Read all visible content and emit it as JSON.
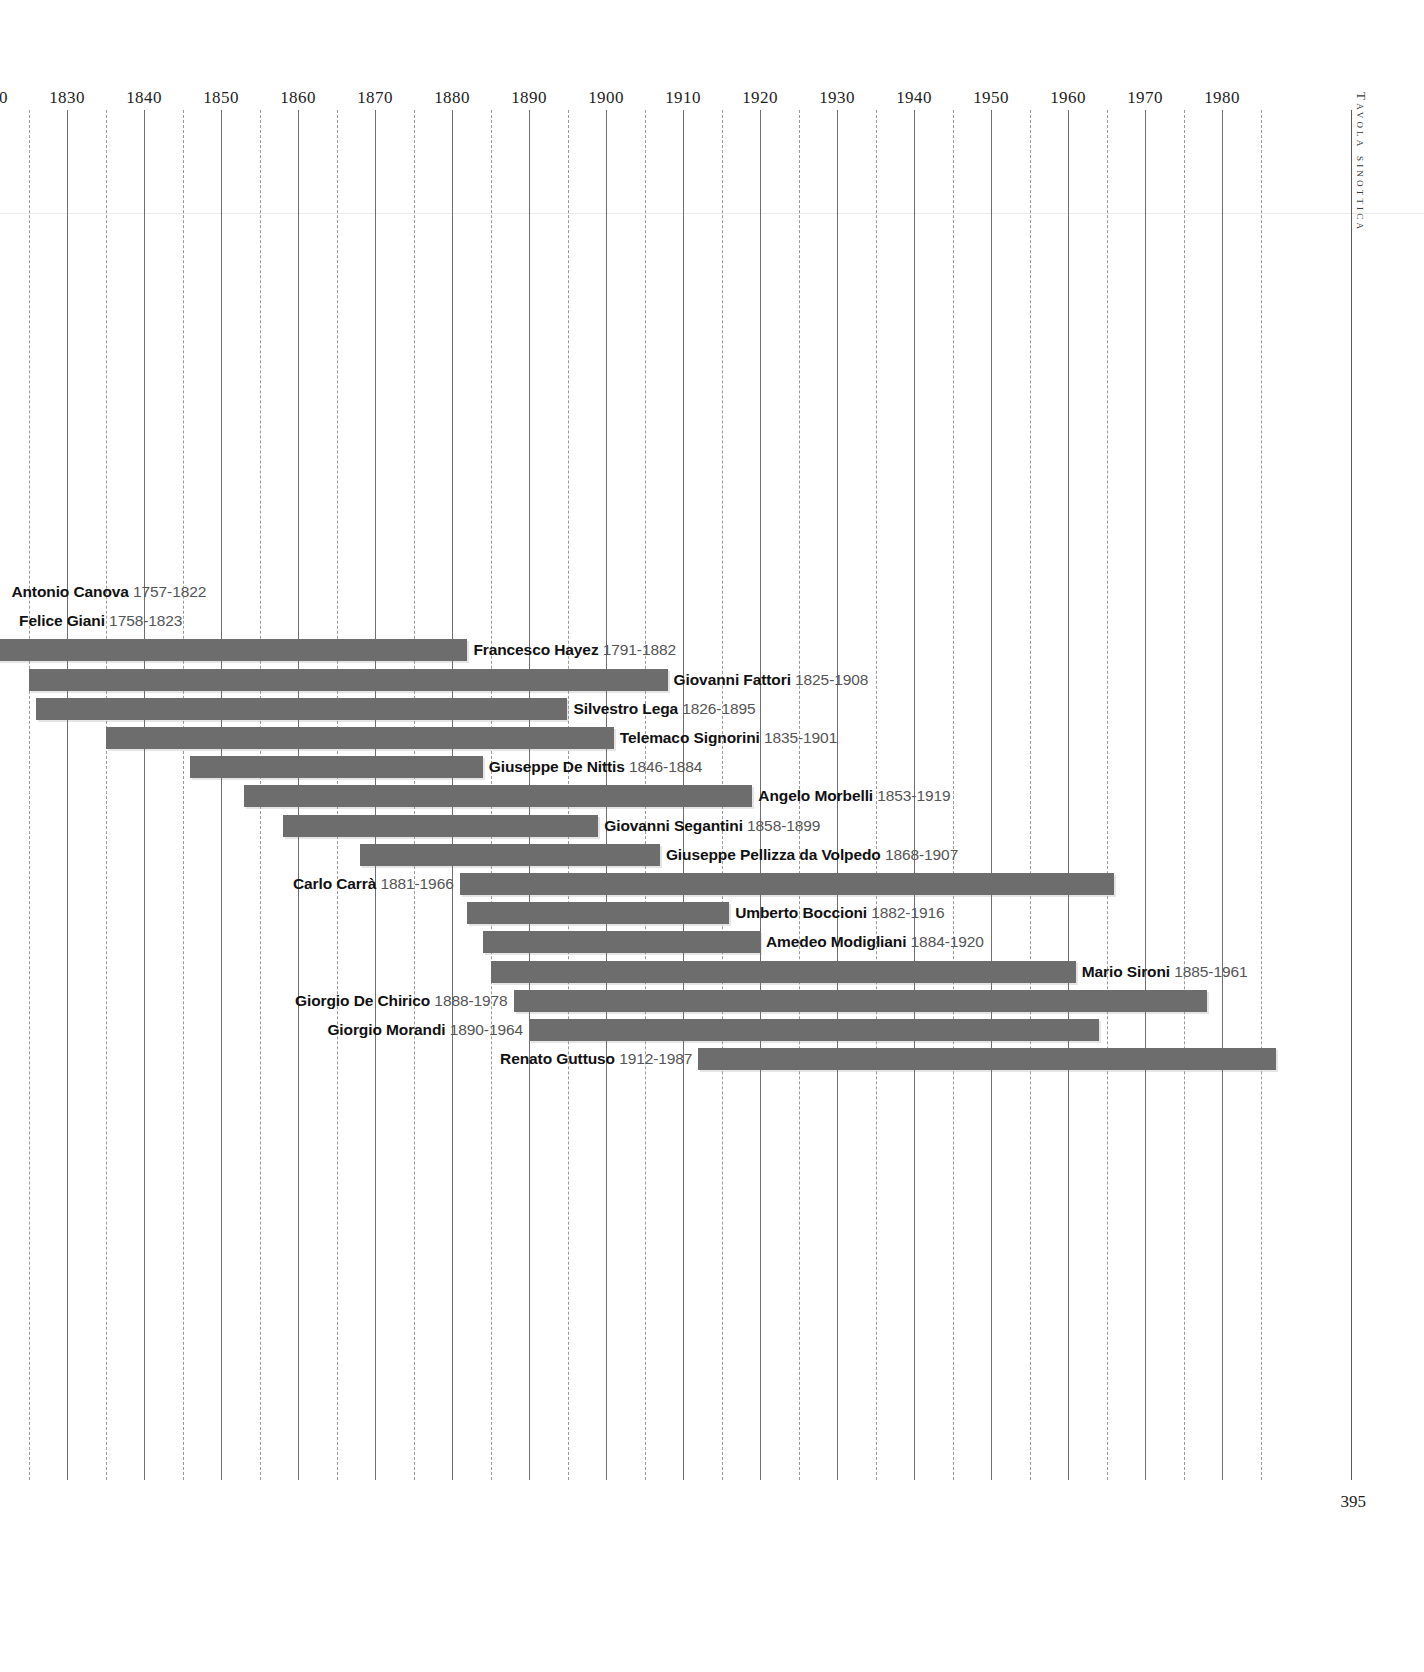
{
  "document": {
    "side_caption": "Tavola sinottica",
    "page_number": "395"
  },
  "chart_data": {
    "type": "bar",
    "title": "Tavola sinottica",
    "orientation": "horizontal",
    "subtype": "timeline-gantt",
    "xlabel": "",
    "ylabel": "",
    "xlim": [
      1820,
      1990
    ],
    "grid": true,
    "grid_major_step": 10,
    "grid_minor_step": 5,
    "legend": "none",
    "bar_color": "#6d6d6d",
    "axis_ticks": [
      "1830",
      "1840",
      "1850",
      "1860",
      "1870",
      "1880",
      "1890",
      "1900",
      "1910",
      "1920",
      "1930",
      "1940",
      "1950",
      "1960",
      "1970",
      "1980"
    ],
    "axis_tick_values": [
      1830,
      1840,
      1850,
      1860,
      1870,
      1880,
      1890,
      1900,
      1910,
      1920,
      1930,
      1940,
      1950,
      1960,
      1970,
      1980
    ],
    "categories": [
      "Antonio Canova",
      "Felice Giani",
      "Francesco Hayez",
      "Giovanni Fattori",
      "Silvestro Lega",
      "Telemaco Signorini",
      "Giuseppe De Nittis",
      "Angelo Morbelli",
      "Giovanni Segantini",
      "Giuseppe Pellizza da Volpedo",
      "Carlo Carrà",
      "Umberto Boccioni",
      "Amedeo Modigliani",
      "Mario Sironi",
      "Giorgio De Chirico",
      "Giorgio Morandi",
      "Renato Guttuso"
    ],
    "bars": [
      {
        "name": "Antonio Canova",
        "years": "1757-1822",
        "start": 1757,
        "end": 1822,
        "label_side": "right",
        "bar_visible": false
      },
      {
        "name": "Felice Giani",
        "years": "1758-1823",
        "start": 1758,
        "end": 1823,
        "label_side": "right",
        "bar_visible": false
      },
      {
        "name": "Francesco Hayez",
        "years": "1791-1882",
        "start": 1791,
        "end": 1882,
        "label_side": "right",
        "bar_visible": true
      },
      {
        "name": "Giovanni Fattori",
        "years": "1825-1908",
        "start": 1825,
        "end": 1908,
        "label_side": "right",
        "bar_visible": true
      },
      {
        "name": "Silvestro Lega",
        "years": "1826-1895",
        "start": 1826,
        "end": 1895,
        "label_side": "right",
        "bar_visible": true
      },
      {
        "name": "Telemaco Signorini",
        "years": "1835-1901",
        "start": 1835,
        "end": 1901,
        "label_side": "right",
        "bar_visible": true
      },
      {
        "name": "Giuseppe De Nittis",
        "years": "1846-1884",
        "start": 1846,
        "end": 1884,
        "label_side": "right",
        "bar_visible": true
      },
      {
        "name": "Angelo Morbelli",
        "years": "1853-1919",
        "start": 1853,
        "end": 1919,
        "label_side": "right",
        "bar_visible": true
      },
      {
        "name": "Giovanni Segantini",
        "years": "1858-1899",
        "start": 1858,
        "end": 1899,
        "label_side": "right",
        "bar_visible": true
      },
      {
        "name": "Giuseppe Pellizza da Volpedo",
        "years": "1868-1907",
        "start": 1868,
        "end": 1907,
        "label_side": "right",
        "bar_visible": true
      },
      {
        "name": "Carlo Carrà",
        "years": "1881-1966",
        "start": 1881,
        "end": 1966,
        "label_side": "left",
        "bar_visible": true
      },
      {
        "name": "Umberto Boccioni",
        "years": "1882-1916",
        "start": 1882,
        "end": 1916,
        "label_side": "right",
        "bar_visible": true
      },
      {
        "name": "Amedeo Modigliani",
        "years": "1884-1920",
        "start": 1884,
        "end": 1920,
        "label_side": "right",
        "bar_visible": true
      },
      {
        "name": "Mario Sironi",
        "years": "1885-1961",
        "start": 1885,
        "end": 1961,
        "label_side": "right",
        "bar_visible": true
      },
      {
        "name": "Giorgio De Chirico",
        "years": "1888-1978",
        "start": 1888,
        "end": 1978,
        "label_side": "left",
        "bar_visible": true
      },
      {
        "name": "Giorgio Morandi",
        "years": "1890-1964",
        "start": 1890,
        "end": 1964,
        "label_side": "left",
        "bar_visible": true
      },
      {
        "name": "Renato Guttuso",
        "years": "1912-1987",
        "start": 1912,
        "end": 1987,
        "label_side": "left",
        "bar_visible": true
      }
    ]
  }
}
